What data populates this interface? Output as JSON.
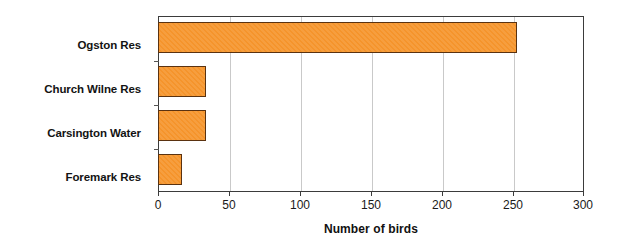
{
  "chart_data": {
    "type": "bar",
    "orientation": "horizontal",
    "title": "",
    "subtitle": "",
    "xlabel": "Number of birds",
    "ylabel": "",
    "categories": [
      "Ogston Res",
      "Church Wilne Res",
      "Carsington Water",
      "Foremark Res"
    ],
    "values": [
      252,
      33,
      33,
      16
    ],
    "xlim": [
      0,
      300
    ],
    "xticks": [
      0,
      50,
      100,
      150,
      200,
      250,
      300
    ],
    "xtick_labels": [
      "0",
      "50",
      "100",
      "150",
      "200",
      "250",
      "300"
    ],
    "grid": "vertical",
    "legend": "none",
    "bar_color": "#F5942B",
    "bar_edge_color": "#5A3210",
    "gridline_color": "#C9C9C9",
    "axis_color": "#3B3B3B",
    "background_color": "#FFFFFF"
  }
}
